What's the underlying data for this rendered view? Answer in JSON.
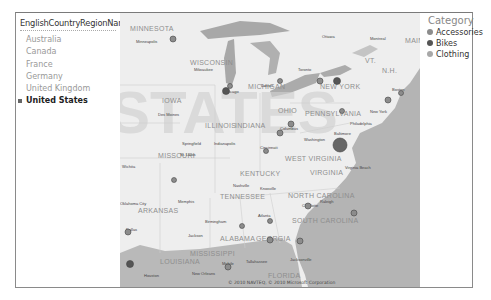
{
  "slicer": {
    "title": "EnglishCountryRegionName",
    "items": [
      {
        "label": "Australia",
        "selected": false
      },
      {
        "label": "Canada",
        "selected": false
      },
      {
        "label": "France",
        "selected": false
      },
      {
        "label": "Germany",
        "selected": false
      },
      {
        "label": "United Kingdom",
        "selected": false
      },
      {
        "label": "United States",
        "selected": true
      }
    ]
  },
  "legend": {
    "title": "Category",
    "items": [
      {
        "label": "Accessories",
        "color": "#8c8c8c"
      },
      {
        "label": "Bikes",
        "color": "#555555"
      },
      {
        "label": "Clothing",
        "color": "#a8a8a8"
      }
    ]
  },
  "map": {
    "watermark": "STATES",
    "copyright": "© 2010 NAVTEQ, © 2010 Microsoft Corporation",
    "state_labels": [
      "MINNESOTA",
      "WISCONSIN",
      "MICHIGAN",
      "IOWA",
      "ILLINOIS",
      "INDIANA",
      "OHIO",
      "PENNSYLVANIA",
      "NEW YORK",
      "MISSOURI",
      "KENTUCKY",
      "WEST VIRGINIA",
      "VIRGINIA",
      "NORTH CAROLINA",
      "TENNESSEE",
      "ARKANSAS",
      "SOUTH CAROLINA",
      "ALABAMA",
      "GEORGIA",
      "MISSISSIPPI",
      "LOUISIANA",
      "FLORIDA",
      "VT.",
      "N.H.",
      "MAINE"
    ],
    "city_labels": [
      "Minneapolis",
      "Milwaukee",
      "Chicago",
      "Detroit",
      "Toronto",
      "Ottawa",
      "Montreal",
      "Boston",
      "New York",
      "Philadelphia",
      "Baltimore",
      "Washington",
      "Virginia Beach",
      "Des Moines",
      "Springfield",
      "Indianapolis",
      "Columbus",
      "Cincinnati",
      "St. Louis",
      "Wichita",
      "Nashville",
      "Knoxville",
      "Memphis",
      "Oklahoma City",
      "Dallas",
      "Birmingham",
      "Atlanta",
      "Jackson",
      "New Orleans",
      "Houston",
      "Tallahassee",
      "Jacksonville",
      "Charlotte",
      "Raleigh",
      "Tampa",
      "Mobile"
    ]
  }
}
